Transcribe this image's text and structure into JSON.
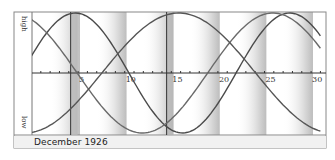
{
  "chart_data": {
    "type": "line",
    "title": "December 1926",
    "xlabel": "",
    "ylabel": "",
    "y_labels": {
      "top": "high",
      "bottom": "low"
    },
    "x_ticks": [
      5,
      10,
      15,
      20,
      25,
      30
    ],
    "x_range": [
      0,
      31
    ],
    "y_range": [
      -1,
      1
    ],
    "grid": false,
    "legend": "none",
    "markers": [
      4.2,
      14.5
    ],
    "series": [
      {
        "name": "physical",
        "period": 23,
        "peak_day": 4.7,
        "color": "#4a4a4a"
      },
      {
        "name": "emotional",
        "period": 28,
        "peak_day": 25.9,
        "color": "#6a6a6a"
      },
      {
        "name": "intellectual",
        "period": 33,
        "peak_day": 15.8,
        "color": "#555555"
      }
    ],
    "shade_bands_end_days": [
      5.2,
      10.2,
      15.2,
      20.2,
      25.2,
      30.2
    ]
  },
  "footer": {
    "label": "December 1926"
  },
  "axis": {
    "high": "high",
    "low": "low"
  }
}
